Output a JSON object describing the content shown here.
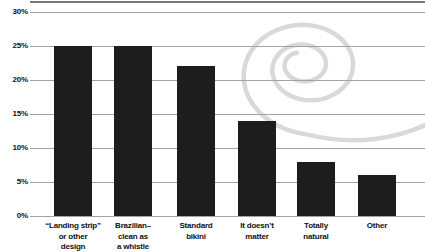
{
  "watermark_icon": "dummies-spiral",
  "colors": {
    "bar": "#1d1d1d",
    "gridline": "#a3a3a3",
    "label": "#111111",
    "spiral": "#d9d9d9",
    "top_rule": "#4a4a4a",
    "background": "#ffffff"
  },
  "chart_data": {
    "type": "bar",
    "title": "",
    "xlabel": "",
    "ylabel": "",
    "ylim": [
      0,
      30
    ],
    "grid": "horizontal",
    "legend": "none",
    "categories": [
      "“Landing strip” or other design",
      "Brazilian–clean as a whistle",
      "Standard bikini",
      "It doesn’t matter",
      "Totally natural",
      "Other"
    ],
    "category_label_lines": [
      [
        "“Landing strip”",
        "or other",
        "design"
      ],
      [
        "Brazilian–",
        "clean as",
        "a whistle"
      ],
      [
        "Standard",
        "bikini"
      ],
      [
        "It doesn’t",
        "matter"
      ],
      [
        "Totally",
        "natural"
      ],
      [
        "Other"
      ]
    ],
    "values": [
      25,
      25,
      22,
      14,
      8,
      6
    ],
    "y_tick_labels": [
      "30%",
      "25%",
      "20%",
      "15%",
      "10%",
      "5%",
      "0%"
    ],
    "y_tick_values": [
      30,
      25,
      20,
      15,
      10,
      5,
      0
    ]
  }
}
